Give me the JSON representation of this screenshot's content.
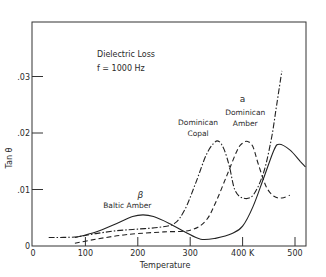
{
  "chart_data": {
    "type": "line",
    "title": "Dielectric Loss",
    "subtitle": "f = 1000 Hz",
    "xlabel": "Temperature",
    "ylabel": "Tan θ",
    "xlim": [
      0,
      520
    ],
    "ylim": [
      0,
      0.036
    ],
    "x_ticks": [
      {
        "value": 0,
        "label": "0"
      },
      {
        "value": 100,
        "label": "100"
      },
      {
        "value": 200,
        "label": "200"
      },
      {
        "value": 300,
        "label": "300"
      },
      {
        "value": 400,
        "label": "400 K"
      },
      {
        "value": 500,
        "label": "500"
      }
    ],
    "y_ticks": [
      {
        "value": 0,
        "label": "0"
      },
      {
        "value": 0.01,
        "label": ".01"
      },
      {
        "value": 0.02,
        "label": ".02"
      },
      {
        "value": 0.03,
        "label": ".03"
      }
    ],
    "grid": false,
    "legend_position": "inline annotations",
    "annotations": [
      {
        "text": "β",
        "x": 205,
        "y": 0.0085
      },
      {
        "text": "Baltic Amber",
        "x": 180,
        "y": 0.0068
      },
      {
        "text": "Dominican",
        "x": 315,
        "y": 0.0215
      },
      {
        "text": "Copal",
        "x": 315,
        "y": 0.0195
      },
      {
        "text": "a",
        "x": 400,
        "y": 0.0255
      },
      {
        "text": "Dominican",
        "x": 405,
        "y": 0.0232
      },
      {
        "text": "Amber",
        "x": 405,
        "y": 0.0212
      }
    ],
    "series": [
      {
        "name": "Baltic Amber",
        "style": "solid",
        "x": [
          80,
          120,
          160,
          190,
          210,
          230,
          260,
          290,
          320,
          350,
          380,
          400,
          420,
          440,
          460,
          470,
          490,
          510,
          520
        ],
        "values": [
          0.0015,
          0.0025,
          0.004,
          0.0052,
          0.0055,
          0.0052,
          0.004,
          0.0025,
          0.0012,
          0.0014,
          0.0022,
          0.0035,
          0.007,
          0.012,
          0.017,
          0.018,
          0.017,
          0.015,
          0.014
        ]
      },
      {
        "name": "Dominican Copal",
        "style": "dash-dot",
        "x": [
          30,
          80,
          120,
          160,
          200,
          240,
          270,
          290,
          310,
          330,
          345,
          355,
          365,
          375,
          385,
          400,
          420,
          440,
          455,
          465,
          475
        ],
        "values": [
          0.0015,
          0.0016,
          0.0022,
          0.0027,
          0.003,
          0.0033,
          0.004,
          0.0065,
          0.011,
          0.016,
          0.0182,
          0.0185,
          0.017,
          0.014,
          0.01,
          0.0085,
          0.009,
          0.013,
          0.019,
          0.025,
          0.031
        ]
      },
      {
        "name": "Dominican Amber",
        "style": "dashed",
        "x": [
          80,
          120,
          160,
          200,
          250,
          300,
          330,
          350,
          370,
          390,
          400,
          410,
          420,
          430,
          445,
          460,
          475,
          490
        ],
        "values": [
          0.0005,
          0.0012,
          0.0018,
          0.0022,
          0.0025,
          0.0028,
          0.0045,
          0.008,
          0.0125,
          0.017,
          0.0182,
          0.0185,
          0.0175,
          0.0145,
          0.0105,
          0.0088,
          0.0085,
          0.009
        ]
      }
    ]
  }
}
